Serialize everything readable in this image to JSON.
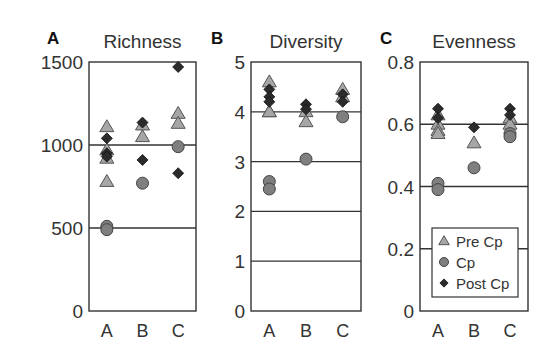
{
  "chart_data": [
    {
      "type": "scatter",
      "panel_label": "A",
      "title": "Richness",
      "xlabel": "",
      "ylabel": "",
      "categories": [
        "A",
        "B",
        "C"
      ],
      "ylim": [
        0,
        1500
      ],
      "yticks": [
        "0",
        "500",
        "1000",
        "1500"
      ],
      "gridlines": [
        500,
        1000
      ],
      "series": [
        {
          "name": "Pre Cp",
          "points": [
            [
              "A",
              1110
            ],
            [
              "A",
              970
            ],
            [
              "A",
              920
            ],
            [
              "A",
              780
            ],
            [
              "B",
              1120
            ],
            [
              "B",
              1050
            ],
            [
              "C",
              1190
            ],
            [
              "C",
              1130
            ]
          ]
        },
        {
          "name": "Cp",
          "points": [
            [
              "A",
              510
            ],
            [
              "A",
              490
            ],
            [
              "B",
              770
            ],
            [
              "C",
              990
            ]
          ]
        },
        {
          "name": "Post Cp",
          "points": [
            [
              "A",
              1040
            ],
            [
              "A",
              950
            ],
            [
              "A",
              930
            ],
            [
              "B",
              1135
            ],
            [
              "B",
              910
            ],
            [
              "C",
              1470
            ],
            [
              "C",
              830
            ]
          ]
        }
      ]
    },
    {
      "type": "scatter",
      "panel_label": "B",
      "title": "Diversity",
      "xlabel": "",
      "ylabel": "",
      "categories": [
        "A",
        "B",
        "C"
      ],
      "ylim": [
        0,
        5
      ],
      "yticks": [
        "0",
        "1",
        "2",
        "3",
        "4",
        "5"
      ],
      "gridlines": [
        1,
        2,
        3,
        4
      ],
      "series": [
        {
          "name": "Pre Cp",
          "points": [
            [
              "A",
              4.6
            ],
            [
              "A",
              4.0
            ],
            [
              "A",
              4.0
            ],
            [
              "B",
              4.0
            ],
            [
              "B",
              3.8
            ],
            [
              "C",
              4.45
            ],
            [
              "C",
              4.3
            ]
          ]
        },
        {
          "name": "Cp",
          "points": [
            [
              "A",
              2.6
            ],
            [
              "A",
              2.45
            ],
            [
              "B",
              3.05
            ],
            [
              "C",
              3.9
            ]
          ]
        },
        {
          "name": "Post Cp",
          "points": [
            [
              "A",
              4.45
            ],
            [
              "A",
              4.3
            ],
            [
              "A",
              4.2
            ],
            [
              "B",
              4.15
            ],
            [
              "B",
              4.05
            ],
            [
              "C",
              4.35
            ],
            [
              "C",
              4.2
            ]
          ]
        }
      ]
    },
    {
      "type": "scatter",
      "panel_label": "C",
      "title": "Evenness",
      "xlabel": "",
      "ylabel": "",
      "categories": [
        "A",
        "B",
        "C"
      ],
      "ylim": [
        0,
        0.8
      ],
      "yticks": [
        "0",
        "0.2",
        "0.4",
        "0.6",
        "0.8"
      ],
      "gridlines": [
        0.2,
        0.4,
        0.6
      ],
      "series": [
        {
          "name": "Pre Cp",
          "points": [
            [
              "A",
              0.63
            ],
            [
              "A",
              0.6
            ],
            [
              "A",
              0.58
            ],
            [
              "A",
              0.57
            ],
            [
              "B",
              0.54
            ],
            [
              "C",
              0.62
            ],
            [
              "C",
              0.6
            ]
          ]
        },
        {
          "name": "Cp",
          "points": [
            [
              "A",
              0.41
            ],
            [
              "A",
              0.39
            ],
            [
              "B",
              0.46
            ],
            [
              "C",
              0.57
            ],
            [
              "C",
              0.56
            ]
          ]
        },
        {
          "name": "Post Cp",
          "points": [
            [
              "A",
              0.65
            ],
            [
              "A",
              0.62
            ],
            [
              "B",
              0.59
            ],
            [
              "C",
              0.65
            ],
            [
              "C",
              0.63
            ]
          ]
        }
      ]
    }
  ],
  "legend": {
    "position": "inside panel C, lower area",
    "items": [
      {
        "label": "Pre Cp",
        "marker": "triangle",
        "color": "#a6a6a6"
      },
      {
        "label": "Cp",
        "marker": "circle",
        "color": "#7f7f7f"
      },
      {
        "label": "Post Cp",
        "marker": "diamond",
        "color": "#2b2b2b"
      }
    ]
  },
  "colors": {
    "pre_cp": "#a6a6a6",
    "cp": "#7f7f7f",
    "post_cp": "#2b2b2b",
    "axis": "#333333",
    "gridline": "#333333"
  }
}
